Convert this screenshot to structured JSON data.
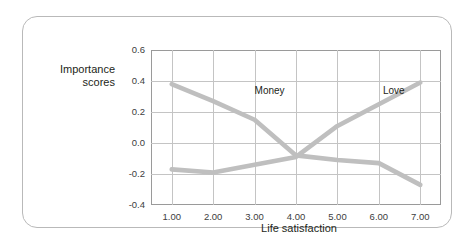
{
  "chart_data": {
    "type": "line",
    "title": "",
    "xlabel": "Life satisfaction",
    "ylabel": "Importance\nscores",
    "xlim": [
      0.5,
      7.5
    ],
    "ylim": [
      -0.4,
      0.6
    ],
    "grid": true,
    "legend_position": "inline-labels",
    "x": [
      1,
      2,
      3,
      4,
      5,
      6,
      7
    ],
    "xtick_labels": [
      "1.00",
      "2.00",
      "3.00",
      "4.00",
      "5.00",
      "6.00",
      "7.00"
    ],
    "ytick_labels": [
      "0.6",
      "0.4",
      "0.2",
      "0.0",
      "-0.2",
      "-0.4"
    ],
    "ytick_values": [
      0.6,
      0.4,
      0.2,
      0.0,
      -0.2,
      -0.4
    ],
    "series": [
      {
        "name": "Money",
        "color": "#bfbfbf",
        "values": [
          0.38,
          0.27,
          0.15,
          -0.08,
          -0.11,
          -0.13,
          -0.27
        ],
        "label_x": 3.0,
        "label_y": 0.33
      },
      {
        "name": "Love",
        "color": "#bfbfbf",
        "values": [
          -0.17,
          -0.19,
          -0.14,
          -0.09,
          0.11,
          0.25,
          0.39
        ],
        "label_x": 6.1,
        "label_y": 0.33
      }
    ]
  },
  "axes": {
    "y_title_line1": "Importance",
    "y_title_line2": "scores",
    "x_title": "Life satisfaction"
  },
  "colors": {
    "line": "#bfbfbf",
    "grid": "#c4c4c4",
    "frame": "#9a9a9a",
    "card_border": "#b9b9b9",
    "text": "#231f20",
    "tick_text": "#404040",
    "background": "#ffffff"
  }
}
